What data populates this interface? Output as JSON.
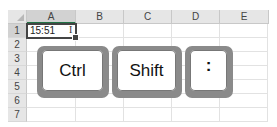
{
  "spreadsheet": {
    "columns": [
      "A",
      "B",
      "C",
      "D",
      "E"
    ],
    "rows": [
      "1",
      "2",
      "3",
      "4",
      "5",
      "6",
      "7"
    ],
    "selected_column": "A",
    "selected_row": "1",
    "active_cell": {
      "ref": "A1",
      "value": "15:51"
    },
    "cursor": "I"
  },
  "keys": [
    {
      "label": "Ctrl"
    },
    {
      "label": "Shift"
    },
    {
      "label": ":"
    }
  ]
}
